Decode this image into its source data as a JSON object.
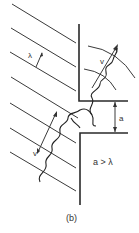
{
  "figure": {
    "panel_label": "(b)",
    "wavelength_label": "λ",
    "velocity_label_incident": "v",
    "velocity_label_transmitted": "v",
    "slit_width_label": "a",
    "condition_label": "a > λ"
  },
  "colors": {
    "line": "#3a3a3a",
    "background": "#ffffff"
  }
}
